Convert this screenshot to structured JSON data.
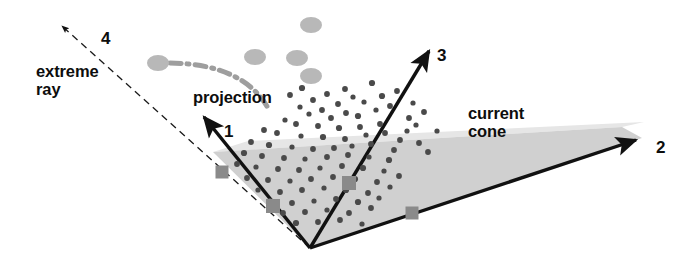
{
  "figure": {
    "width": 689,
    "height": 269,
    "background_color": "#ffffff"
  },
  "labels": {
    "extreme_ray": "extreme\nray",
    "projection": "projection",
    "current_cone": "current\ncone",
    "axis_1": "1",
    "axis_2": "2",
    "axis_3": "3",
    "axis_4": "4"
  },
  "colors": {
    "line": "#111111",
    "cone_fill": "#cfcfcf",
    "cone_fill_upper": "#e2e2e2",
    "square_marker": "#8a8a8a",
    "ellipse_marker": "#b8b8b8",
    "dot_marker": "#4a4a4a",
    "arc": "#9a9a9a",
    "background": "#ffffff"
  },
  "geometry": {
    "origin": {
      "x": 310,
      "y": 248
    },
    "axes": [
      {
        "name": "axis-1",
        "label": "1",
        "style": "solid",
        "tip": {
          "x": 200,
          "y": 113
        }
      },
      {
        "name": "axis-2",
        "label": "2",
        "style": "solid",
        "tip": {
          "x": 642,
          "y": 138
        }
      },
      {
        "name": "axis-3",
        "label": "3",
        "style": "solid",
        "tip": {
          "x": 432,
          "y": 46
        }
      },
      {
        "name": "axis-4",
        "label": "4",
        "style": "dashed",
        "tip": {
          "x": 56,
          "y": 22
        }
      }
    ],
    "cone_polygon": [
      {
        "x": 310,
        "y": 248
      },
      {
        "x": 213,
        "y": 152
      },
      {
        "x": 622,
        "y": 127
      },
      {
        "x": 642,
        "y": 138
      }
    ],
    "cone_upper_polygon": [
      {
        "x": 213,
        "y": 152
      },
      {
        "x": 622,
        "y": 127
      },
      {
        "x": 640,
        "y": 124
      },
      {
        "x": 250,
        "y": 142
      }
    ]
  },
  "markers": {
    "squares": [
      {
        "x": 222,
        "y": 172,
        "size": 13
      },
      {
        "x": 273,
        "y": 206,
        "size": 14
      },
      {
        "x": 349,
        "y": 183,
        "size": 14
      },
      {
        "x": 412,
        "y": 213,
        "size": 13
      }
    ],
    "ellipses": [
      {
        "x": 158,
        "y": 63,
        "rx": 11,
        "ry": 8
      },
      {
        "x": 255,
        "y": 57,
        "rx": 11,
        "ry": 8
      },
      {
        "x": 297,
        "y": 58,
        "rx": 11,
        "ry": 8
      },
      {
        "x": 311,
        "y": 25,
        "rx": 11,
        "ry": 8
      },
      {
        "x": 311,
        "y": 76,
        "rx": 11,
        "ry": 8
      }
    ],
    "dots": [
      [
        372,
        83
      ],
      [
        345,
        89
      ],
      [
        327,
        94
      ],
      [
        353,
        97
      ],
      [
        313,
        100
      ],
      [
        338,
        104
      ],
      [
        364,
        102
      ],
      [
        382,
        96
      ],
      [
        397,
        91
      ],
      [
        300,
        107
      ],
      [
        322,
        110
      ],
      [
        346,
        113
      ],
      [
        309,
        114
      ],
      [
        331,
        118
      ],
      [
        358,
        116
      ],
      [
        376,
        110
      ],
      [
        390,
        106
      ],
      [
        409,
        118
      ],
      [
        285,
        120
      ],
      [
        296,
        124
      ],
      [
        318,
        126
      ],
      [
        339,
        128
      ],
      [
        360,
        127
      ],
      [
        380,
        124
      ],
      [
        407,
        131
      ],
      [
        264,
        130
      ],
      [
        277,
        133
      ],
      [
        301,
        136
      ],
      [
        323,
        137
      ],
      [
        345,
        139
      ],
      [
        366,
        135
      ],
      [
        385,
        133
      ],
      [
        400,
        140
      ],
      [
        416,
        125
      ],
      [
        251,
        142
      ],
      [
        269,
        145
      ],
      [
        292,
        147
      ],
      [
        313,
        149
      ],
      [
        334,
        148
      ],
      [
        352,
        146
      ],
      [
        371,
        144
      ],
      [
        394,
        150
      ],
      [
        244,
        153
      ],
      [
        262,
        156
      ],
      [
        284,
        158
      ],
      [
        305,
        159
      ],
      [
        327,
        157
      ],
      [
        348,
        155
      ],
      [
        369,
        157
      ],
      [
        389,
        160
      ],
      [
        237,
        164
      ],
      [
        256,
        167
      ],
      [
        278,
        169
      ],
      [
        299,
        170
      ],
      [
        320,
        168
      ],
      [
        342,
        166
      ],
      [
        363,
        168
      ],
      [
        384,
        171
      ],
      [
        247,
        178
      ],
      [
        268,
        180
      ],
      [
        290,
        181
      ],
      [
        311,
        179
      ],
      [
        333,
        177
      ],
      [
        355,
        179
      ],
      [
        377,
        182
      ],
      [
        399,
        176
      ],
      [
        258,
        190
      ],
      [
        280,
        192
      ],
      [
        302,
        190
      ],
      [
        324,
        188
      ],
      [
        346,
        190
      ],
      [
        368,
        193
      ],
      [
        390,
        187
      ],
      [
        270,
        201
      ],
      [
        292,
        203
      ],
      [
        314,
        201
      ],
      [
        336,
        199
      ],
      [
        358,
        202
      ],
      [
        379,
        198
      ],
      [
        283,
        213
      ],
      [
        305,
        212
      ],
      [
        327,
        210
      ],
      [
        349,
        213
      ],
      [
        371,
        208
      ],
      [
        296,
        223
      ],
      [
        318,
        222
      ],
      [
        340,
        220
      ],
      [
        362,
        224
      ],
      [
        419,
        143
      ],
      [
        428,
        152
      ],
      [
        437,
        131
      ],
      [
        302,
        88
      ],
      [
        290,
        95
      ],
      [
        413,
        103
      ],
      [
        424,
        112
      ]
    ],
    "arc": {
      "start": {
        "x": 170,
        "y": 63
      },
      "control": {
        "x": 240,
        "y": 66
      },
      "end": {
        "x": 268,
        "y": 107
      }
    }
  }
}
